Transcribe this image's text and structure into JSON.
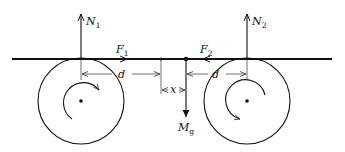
{
  "diagram": {
    "labels": {
      "n1": {
        "main": "N",
        "sub": "1"
      },
      "n2": {
        "main": "N",
        "sub": "2"
      },
      "f1": {
        "main": "F",
        "sub": "1"
      },
      "f2": {
        "main": "F",
        "sub": "2"
      },
      "d_left": {
        "main": "d"
      },
      "d_right": {
        "main": "d"
      },
      "x": {
        "main": "x"
      },
      "mg": {
        "main": "M",
        "sub": "g"
      }
    },
    "rollers": [
      {
        "name": "left-roller",
        "rotation": "clockwise"
      },
      {
        "name": "right-roller",
        "rotation": "clockwise"
      }
    ],
    "colors": {
      "ink": "#111111",
      "background": "#ffffff"
    }
  }
}
